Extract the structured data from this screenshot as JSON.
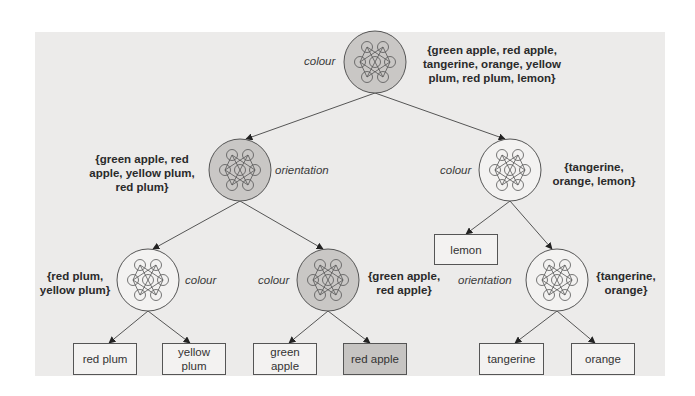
{
  "colors": {
    "panel_bg": "#ecebea",
    "node_gray": "#c9c7c5",
    "node_white": "#f3f2f1",
    "stroke": "#555555",
    "highlight_leaf": "#c6c4c2"
  },
  "nodes": {
    "root": {
      "feature": "colour",
      "set": "{green apple, red apple, tangerine, orange, yellow plum, red plum, lemon}",
      "set_lines": [
        "{green apple, red apple,",
        "tangerine, orange, yellow",
        "plum, red plum, lemon}"
      ],
      "highlighted": true
    },
    "left": {
      "feature": "orientation",
      "set_lines": [
        "{green apple, red",
        "apple, yellow plum,",
        "red plum}"
      ],
      "highlighted": true
    },
    "right": {
      "feature": "colour",
      "set_lines": [
        "{tangerine,",
        "orange, lemon}"
      ],
      "highlighted": false
    },
    "left_left": {
      "feature": "colour",
      "set_lines": [
        "{red plum,",
        "yellow plum}"
      ],
      "highlighted": false
    },
    "left_right": {
      "feature": "colour",
      "set_lines": [
        "{green apple,",
        "red apple}"
      ],
      "highlighted": true
    },
    "right_right": {
      "feature": "orientation",
      "set_lines": [
        "{tangerine,",
        "orange}"
      ],
      "highlighted": false
    }
  },
  "leaves": [
    {
      "label": "red plum",
      "highlighted": false
    },
    {
      "label": "yellow plum",
      "highlighted": false
    },
    {
      "label": "green apple",
      "highlighted": false
    },
    {
      "label": "red apple",
      "highlighted": true
    },
    {
      "label": "lemon",
      "highlighted": false
    },
    {
      "label": "tangerine",
      "highlighted": false
    },
    {
      "label": "orange",
      "highlighted": false
    }
  ]
}
